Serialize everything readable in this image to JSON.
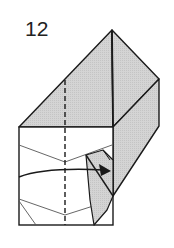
{
  "step": {
    "number": "12"
  },
  "diagram": {
    "colors": {
      "shade": "#cfcfcf",
      "line": "#1a1a1a",
      "thin_line": "#555555",
      "paper": "#ffffff"
    },
    "arrow": {
      "direction": "right",
      "meaning": "tuck-in"
    }
  }
}
